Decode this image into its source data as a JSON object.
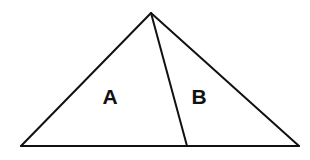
{
  "diagram": {
    "type": "geometry",
    "stroke_color": "#111111",
    "background": "#ffffff",
    "points": {
      "apex": [
        151,
        13
      ],
      "base_left": [
        21,
        146
      ],
      "base_right": [
        299,
        146
      ],
      "divider_foot": [
        187,
        146
      ]
    },
    "regions": [
      {
        "label": "A",
        "position": [
          110,
          104
        ]
      },
      {
        "label": "B",
        "position": [
          199,
          104
        ]
      }
    ]
  }
}
